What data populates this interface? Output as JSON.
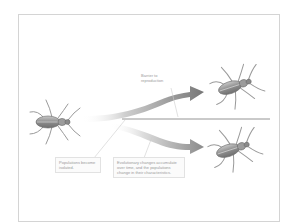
{
  "diagram": {
    "topic": "Allopatric speciation",
    "labels": {
      "barrier": "Barrier to reproduction",
      "isolated": "Populations become isolated.",
      "accumulate": "Evolutionary changes accumulate over time, and the populations change in their characteristics."
    },
    "nodes": [
      {
        "id": "ancestral-beetle",
        "role": "original population"
      },
      {
        "id": "upper-beetle",
        "role": "descendant population A"
      },
      {
        "id": "lower-beetle",
        "role": "descendant population B"
      }
    ],
    "edges": [
      {
        "from": "ancestral-beetle",
        "to": "upper-beetle"
      },
      {
        "from": "ancestral-beetle",
        "to": "lower-beetle"
      }
    ],
    "colors": {
      "arrow": "#8c8c8c",
      "barrier_line": "#7a7a7a",
      "beetle_body": "#9a9a9a",
      "frame": "#d4d4d4",
      "text": "#9a9a9a"
    }
  }
}
